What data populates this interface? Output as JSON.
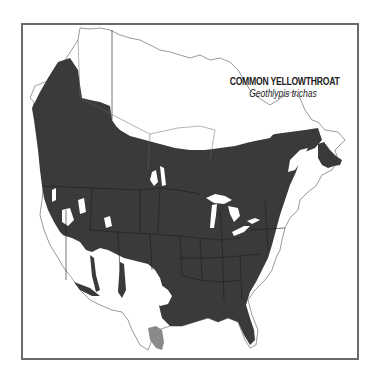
{
  "map": {
    "title": "COMMON YELLOWTHROAT",
    "subtitle": "Geothlypis trichas",
    "legend_colors": {
      "breeding_range": "#3a3a3a",
      "year_round_range": "#8a8a8a",
      "outside_range": "#ffffff"
    },
    "frame_color": "#6a6a6a",
    "regions": [
      {
        "name": "breeding-range",
        "description": "Dark-shaded breeding range across most of North America south of the boreal line"
      },
      {
        "name": "winter-year-round-range",
        "description": "Gray-shaded area in southern Texas"
      },
      {
        "name": "outside-range",
        "description": "Unshaded northern Canada, Alaska north, and arid southwest"
      }
    ]
  }
}
